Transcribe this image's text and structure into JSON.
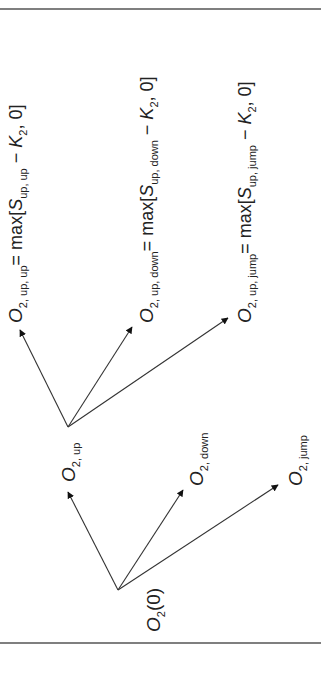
{
  "diagram": {
    "type": "option-price-tree",
    "orientation": "rotated -90deg (reads bottom-to-top)",
    "colors": {
      "line": "#333333",
      "text": "#222222",
      "rule": "#555555",
      "background": "#ffffff"
    },
    "nodes": {
      "root": {
        "main": "O",
        "sub": "2",
        "rest": "(0)"
      },
      "level1": [
        {
          "id": "up",
          "main": "O",
          "sub": "2, up"
        },
        {
          "id": "down",
          "main": "O",
          "sub": "2, down"
        },
        {
          "id": "jump",
          "main": "O",
          "sub": "2, jump"
        }
      ],
      "level2": [
        {
          "id": "up-up",
          "main": "O",
          "sub": "2, up, up",
          "eq": "= max[",
          "s": "S",
          "s_sub": "up, up",
          "minus": " − ",
          "k": "K",
          "k_sub": "2",
          "tail": ", 0]"
        },
        {
          "id": "up-down",
          "main": "O",
          "sub": "2, up, down",
          "eq": "= max[",
          "s": "S",
          "s_sub": "up, down",
          "minus": " − ",
          "k": "K",
          "k_sub": "2",
          "tail": ", 0]"
        },
        {
          "id": "up-jump",
          "main": "O",
          "sub": "2, up, jump",
          "eq": "= max[",
          "s": "S",
          "s_sub": "up, jump",
          "minus": " − ",
          "k": "K",
          "k_sub": "2",
          "tail": ", 0]"
        }
      ]
    },
    "edges": [
      {
        "from": "root",
        "to": "up"
      },
      {
        "from": "root",
        "to": "down"
      },
      {
        "from": "root",
        "to": "jump"
      },
      {
        "from": "up",
        "to": "up-up"
      },
      {
        "from": "up",
        "to": "up-down"
      },
      {
        "from": "up",
        "to": "up-jump"
      }
    ]
  }
}
